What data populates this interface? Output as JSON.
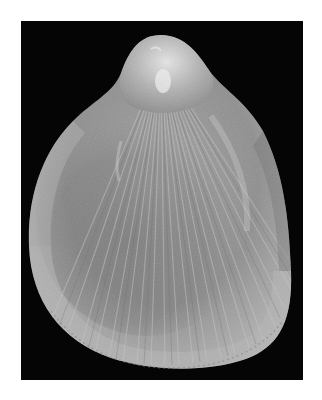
{
  "image": {
    "subject": "Bivalve seashell (single valve) with radial ribs",
    "background_color": "#050505",
    "border_color": "#ffffff",
    "shell_base_color": "#9a9a9a",
    "shell_highlight_color": "#d8d8d8",
    "shell_shadow_color": "#5e5e5e",
    "rib_color": "#bdbdbd"
  }
}
